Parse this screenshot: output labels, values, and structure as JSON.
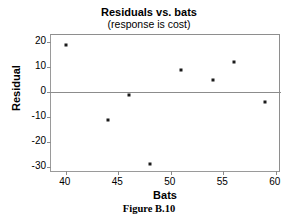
{
  "chart_data": {
    "type": "scatter",
    "title": "Residuals vs. bats",
    "subtitle": "(response is cost)",
    "xlabel": "Bats",
    "ylabel": "Residual",
    "xlim": [
      38.6,
      60.5
    ],
    "ylim": [
      -32.5,
      23.0
    ],
    "xticks": [
      40,
      45,
      50,
      55,
      60
    ],
    "yticks": [
      20,
      10,
      0,
      -10,
      -20,
      -30
    ],
    "xtick_labels": [
      "40",
      "45",
      "50",
      "55",
      "60"
    ],
    "ytick_labels": [
      "20",
      "10",
      "0",
      "-10",
      "-20",
      "-30"
    ],
    "grid": false,
    "legend": "none",
    "zero_reference_line": 0,
    "marker": "square",
    "marker_color": "#1a1a1a",
    "points": [
      {
        "x": 40.0,
        "y": 19.0
      },
      {
        "x": 44.0,
        "y": -11.0
      },
      {
        "x": 46.0,
        "y": -1.0
      },
      {
        "x": 48.0,
        "y": -29.0
      },
      {
        "x": 51.0,
        "y": 9.0
      },
      {
        "x": 54.0,
        "y": 5.0
      },
      {
        "x": 56.0,
        "y": 12.0
      },
      {
        "x": 59.0,
        "y": -4.0
      }
    ],
    "x": [
      40.0,
      44.0,
      46.0,
      48.0,
      51.0,
      54.0,
      56.0,
      59.0
    ],
    "values": [
      19.0,
      -11.0,
      -1.0,
      -29.0,
      9.0,
      5.0,
      12.0,
      -4.0
    ]
  },
  "caption": {
    "text": "Figure B.10"
  },
  "colors": {
    "axis": "#8c8c8c",
    "frame": "#9a9a9a",
    "marker": "#1a1a1a",
    "text": "#000000",
    "background": "#ffffff"
  }
}
